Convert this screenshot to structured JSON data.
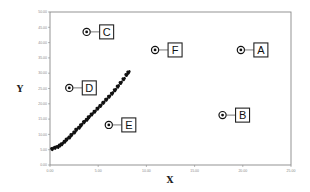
{
  "chart_data": {
    "type": "scatter",
    "title": "",
    "xlabel": "X",
    "ylabel": "Y",
    "xlim": [
      0,
      25
    ],
    "ylim": [
      0,
      50
    ],
    "x_ticks": [
      "0.00",
      "5.00",
      "10.00",
      "15.00",
      "20.00",
      "25.00"
    ],
    "y_ticks": [
      "0.00",
      "5.00",
      "10.00",
      "15.00",
      "20.00",
      "25.00",
      "30.00",
      "35.00",
      "40.00",
      "45.00",
      "50.00"
    ],
    "grid": false,
    "legend": null,
    "series": [
      {
        "name": "main cluster",
        "marker": "filled dot",
        "points": [
          [
            0.2,
            5.2
          ],
          [
            0.5,
            5.6
          ],
          [
            0.8,
            5.9
          ],
          [
            1.0,
            6.4
          ],
          [
            1.2,
            6.8
          ],
          [
            1.5,
            7.6
          ],
          [
            1.7,
            8.3
          ],
          [
            2.0,
            9.0
          ],
          [
            2.2,
            9.8
          ],
          [
            2.5,
            10.6
          ],
          [
            2.7,
            11.5
          ],
          [
            3.0,
            12.2
          ],
          [
            3.2,
            13.0
          ],
          [
            3.5,
            14.0
          ],
          [
            3.8,
            14.8
          ],
          [
            4.0,
            15.6
          ],
          [
            4.3,
            16.5
          ],
          [
            4.6,
            17.4
          ],
          [
            4.9,
            18.4
          ],
          [
            5.2,
            19.3
          ],
          [
            5.5,
            20.3
          ],
          [
            5.8,
            21.3
          ],
          [
            6.1,
            22.3
          ],
          [
            6.4,
            23.3
          ],
          [
            6.7,
            24.4
          ],
          [
            7.0,
            25.6
          ],
          [
            7.3,
            26.8
          ],
          [
            7.6,
            28.0
          ],
          [
            7.9,
            29.4
          ],
          [
            8.1,
            30.2
          ]
        ]
      },
      {
        "name": "labeled outliers",
        "marker": "circled dot",
        "points": [
          {
            "label": "A",
            "x": 19.8,
            "y": 37.6
          },
          {
            "label": "B",
            "x": 17.9,
            "y": 16.3
          },
          {
            "label": "C",
            "x": 3.8,
            "y": 43.5
          },
          {
            "label": "D",
            "x": 2.0,
            "y": 25.2
          },
          {
            "label": "E",
            "x": 6.1,
            "y": 13.1
          },
          {
            "label": "F",
            "x": 10.9,
            "y": 37.6
          }
        ]
      }
    ],
    "annotations": [
      "A",
      "B",
      "C",
      "D",
      "E",
      "F"
    ]
  },
  "layout": {
    "plot": {
      "left": 50,
      "right": 291,
      "top": 12,
      "bottom": 165
    },
    "label_offset": 20,
    "colors": {
      "axis": "#888888",
      "marker": "#111111",
      "box": "#222222"
    }
  }
}
